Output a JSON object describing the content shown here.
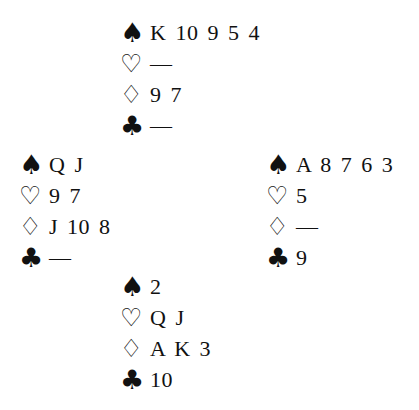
{
  "suit_symbols": {
    "spades": "♠",
    "hearts": "♡",
    "diamonds": "♢",
    "clubs": "♣"
  },
  "hands": {
    "north": {
      "spades": "K 10 9 5 4",
      "hearts": "—",
      "diamonds": "9 7",
      "clubs": "—"
    },
    "west": {
      "spades": "Q J",
      "hearts": "9 7",
      "diamonds": "J 10 8",
      "clubs": "—"
    },
    "east": {
      "spades": "A 8 7 6 3",
      "hearts": "5",
      "diamonds": "—",
      "clubs": "9"
    },
    "south": {
      "spades": "2",
      "hearts": "Q J",
      "diamonds": "A K 3",
      "clubs": "10"
    }
  }
}
